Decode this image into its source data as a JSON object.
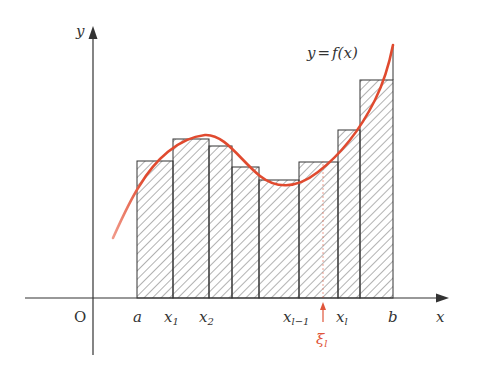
{
  "diagram": {
    "colors": {
      "axis": "#333333",
      "curve": "#e04a2f",
      "xi_marker": "#e0553a",
      "hatch": "#555555"
    },
    "axes": {
      "x_label": "x",
      "y_label": "y",
      "origin_label": "O"
    },
    "curve_label": {
      "prefix": "y",
      "eq": "=",
      "func": "f(x)"
    },
    "x_ticks": [
      {
        "main": "a",
        "sub": ""
      },
      {
        "main": "x",
        "sub": "1"
      },
      {
        "main": "x",
        "sub": "2"
      },
      {
        "main": "x",
        "sub": "l−1"
      },
      {
        "main": "x",
        "sub": "l"
      },
      {
        "main": "b",
        "sub": ""
      }
    ],
    "xi_marker": {
      "main": "ξ",
      "sub": "l"
    },
    "rectangles": [
      {
        "x0": 137,
        "x1": 173,
        "top": 161
      },
      {
        "x0": 173,
        "x1": 209,
        "top": 139
      },
      {
        "x0": 209,
        "x1": 232,
        "top": 146
      },
      {
        "x0": 232,
        "x1": 259,
        "top": 167
      },
      {
        "x0": 259,
        "x1": 299,
        "top": 180
      },
      {
        "x0": 299,
        "x1": 338,
        "top": 162
      },
      {
        "x0": 338,
        "x1": 360,
        "top": 130
      },
      {
        "x0": 360,
        "x1": 393,
        "top": 80
      }
    ]
  }
}
